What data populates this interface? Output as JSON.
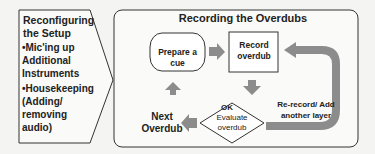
{
  "left_panel": {
    "title": "Reconfiguring the Setup",
    "items": [
      {
        "bullet": "•",
        "text": "Mic'ing up Additional Instruments"
      },
      {
        "bullet": "•",
        "text": "Housekeeping (Adding/ removing audio)"
      }
    ]
  },
  "main_panel": {
    "title": "Recording the Overdubs",
    "nodes": {
      "prepare": "Prepare a cue",
      "record": "Record overdub",
      "evaluate": "Evaluate overdub",
      "next": "Next Overdub"
    },
    "labels": {
      "ok": "OK",
      "rerecord": "Re-record/ Add another layer"
    }
  },
  "colors": {
    "stroke": "#333333",
    "arrow": "#8c8c8c",
    "background": "#f4f4f2"
  }
}
